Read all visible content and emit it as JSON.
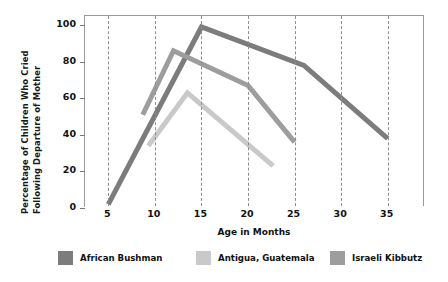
{
  "chart_data": {
    "type": "line",
    "title": "",
    "xlabel": "Age in Months",
    "ylabel_line1": "Percentage of Children Who Cried",
    "ylabel_line2": "Following Departure of Mother",
    "xlim": [
      2.5,
      39
    ],
    "ylim": [
      0,
      105
    ],
    "xticks": [
      5,
      10,
      15,
      20,
      25,
      30,
      35
    ],
    "xtick_labels": [
      "5",
      "10",
      "15",
      "20",
      "25",
      "30",
      "35"
    ],
    "yticks": [
      0,
      20,
      40,
      60,
      80,
      100
    ],
    "ytick_labels": [
      "0",
      "20",
      "40",
      "60",
      "80",
      "100"
    ],
    "grid": "vertical-dashed",
    "legend_position": "below-axes",
    "series": [
      {
        "name": "African Bushman",
        "color": "#7c7c7c",
        "x": [
          5,
          15,
          26,
          35
        ],
        "y": [
          2,
          99,
          78,
          38
        ]
      },
      {
        "name": "Antigua, Guatemala",
        "color": "#c9c9c9",
        "x": [
          9.3,
          13.5,
          22.7
        ],
        "y": [
          34,
          63,
          23
        ]
      },
      {
        "name": "Israeli Kibbutz",
        "color": "#9d9d9d",
        "x": [
          8.7,
          12,
          20,
          25
        ],
        "y": [
          51,
          86,
          67,
          36
        ]
      }
    ]
  },
  "legend": {
    "items": [
      {
        "label": "African Bushman",
        "color": "#7c7c7c"
      },
      {
        "label": "Antigua, Guatemala",
        "color": "#c9c9c9"
      },
      {
        "label": "Israeli Kibbutz",
        "color": "#9d9d9d"
      }
    ]
  },
  "axes": {
    "x_title": "Age in Months",
    "y_title_line1": "Percentage of Children Who Cried",
    "y_title_line2": "Following Departure of Mother"
  }
}
